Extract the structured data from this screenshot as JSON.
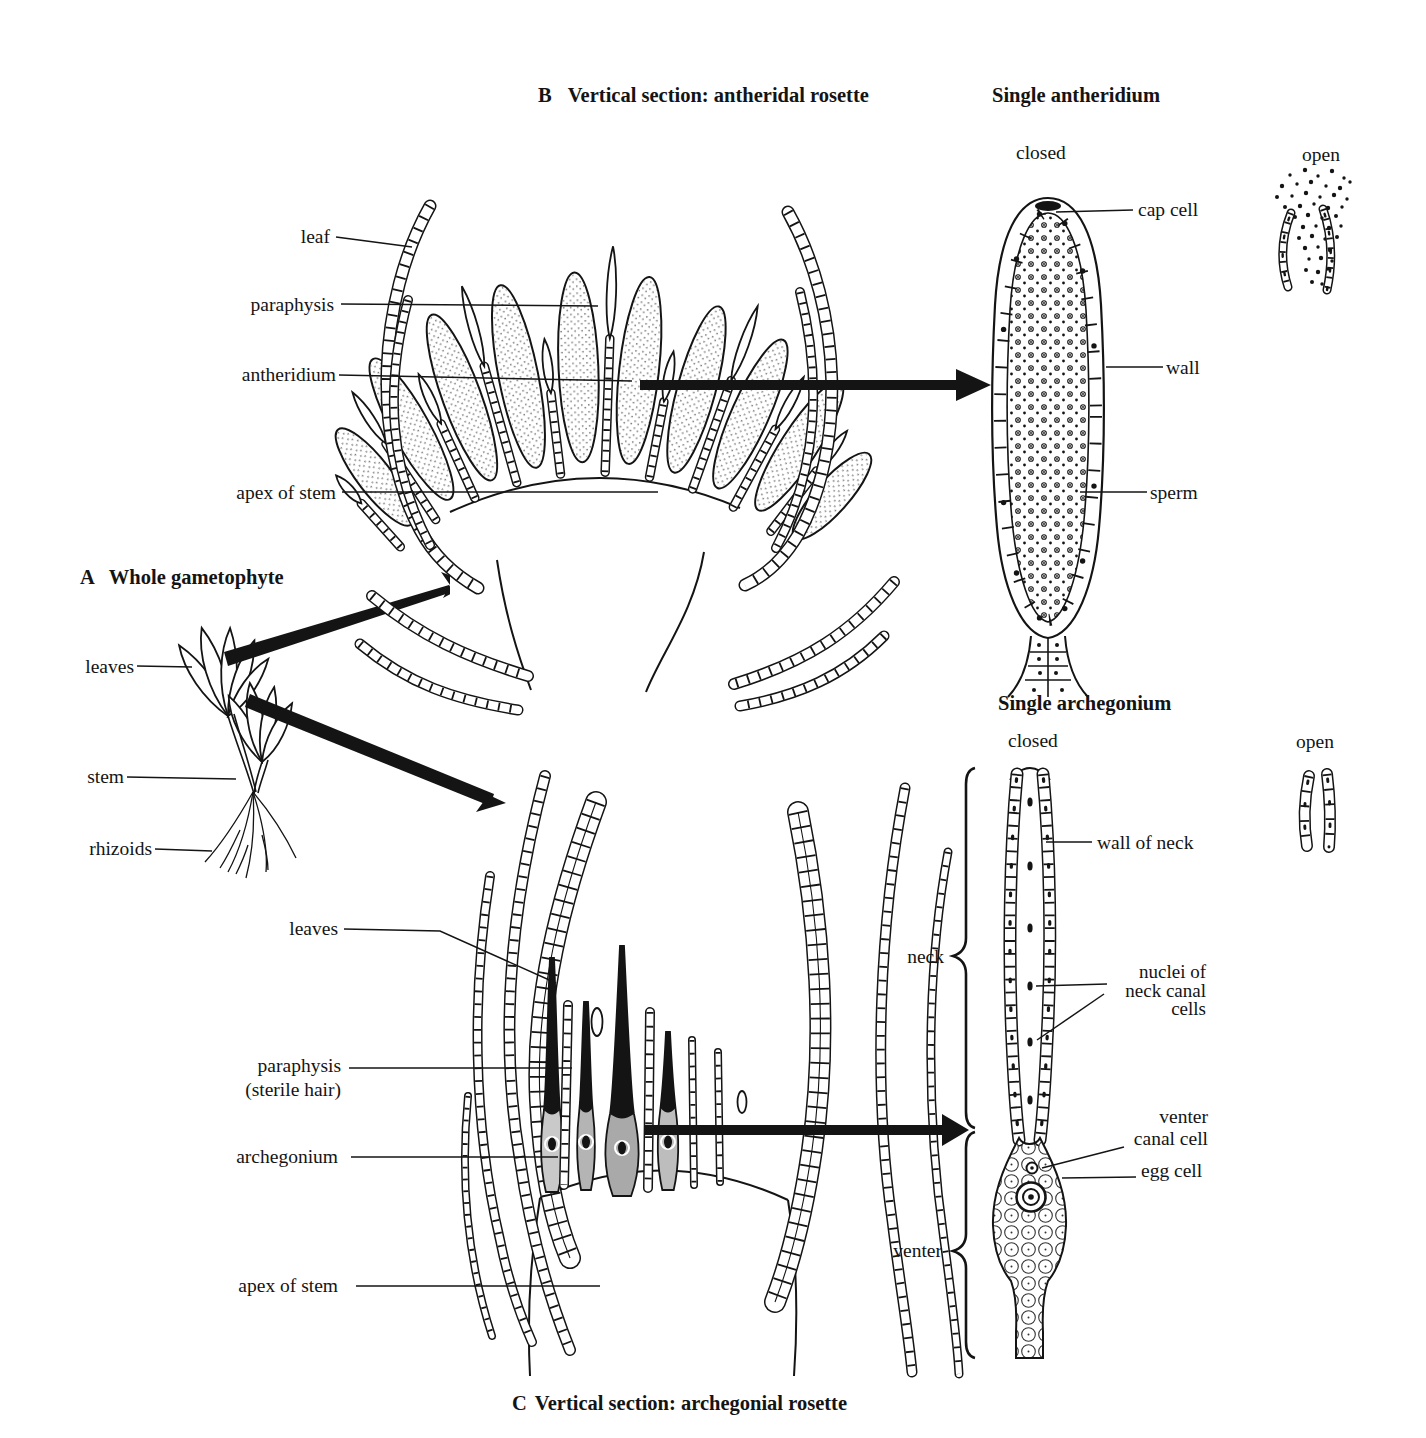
{
  "figure": {
    "panel_a": {
      "letter": "A",
      "title": "Whole gametophyte",
      "label_leaves": "leaves",
      "label_stem": "stem",
      "label_rhizoids": "rhizoids"
    },
    "panel_b": {
      "letter": "B",
      "title": "Vertical section: antheridal rosette",
      "label_leaf": "leaf",
      "label_paraphysis": "paraphysis",
      "label_antheridium": "antheridium",
      "label_apex": "apex of stem"
    },
    "panel_c": {
      "letter": "C",
      "title": "Vertical section: archegonial rosette",
      "label_leaves": "leaves",
      "label_paraphysis_line1": "paraphysis",
      "label_paraphysis_line2": "(sterile hair)",
      "label_archegonium": "archegonium",
      "label_apex": "apex of stem"
    },
    "antheridium_panel": {
      "title": "Single antheridium",
      "state_closed": "closed",
      "state_open": "open",
      "label_cap_cell": "cap cell",
      "label_wall": "wall",
      "label_sperm": "sperm"
    },
    "archegonium_panel": {
      "title": "Single archegonium",
      "state_closed": "closed",
      "state_open": "open",
      "label_wall_of_neck": "wall of neck",
      "label_nuclei_line1": "nuclei of",
      "label_nuclei_line2": "neck canal",
      "label_nuclei_line3": "cells",
      "label_venter_canal_line1": "venter",
      "label_venter_canal_line2": "canal cell",
      "label_egg_cell": "egg cell",
      "label_neck": "neck",
      "label_venter": "venter"
    },
    "ink_color": "#141414"
  }
}
